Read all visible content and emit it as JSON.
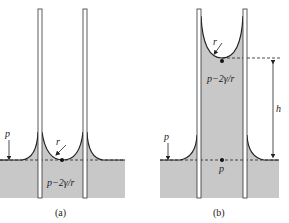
{
  "figure": {
    "panels": [
      {
        "id": "a",
        "caption": "(a)",
        "labels": {
          "pressure_outside": "p",
          "radius": "r",
          "pressure_inside": "p−2γ/r"
        }
      },
      {
        "id": "b",
        "caption": "(b)",
        "labels": {
          "radius": "r",
          "pressure_inside": "p−2γ/r",
          "height": "h",
          "pressure_outside": "p",
          "pressure_bottom": "p"
        }
      }
    ],
    "colors": {
      "liquid": "#c8c8c8",
      "line": "#222222",
      "background": "#ffffff"
    }
  }
}
